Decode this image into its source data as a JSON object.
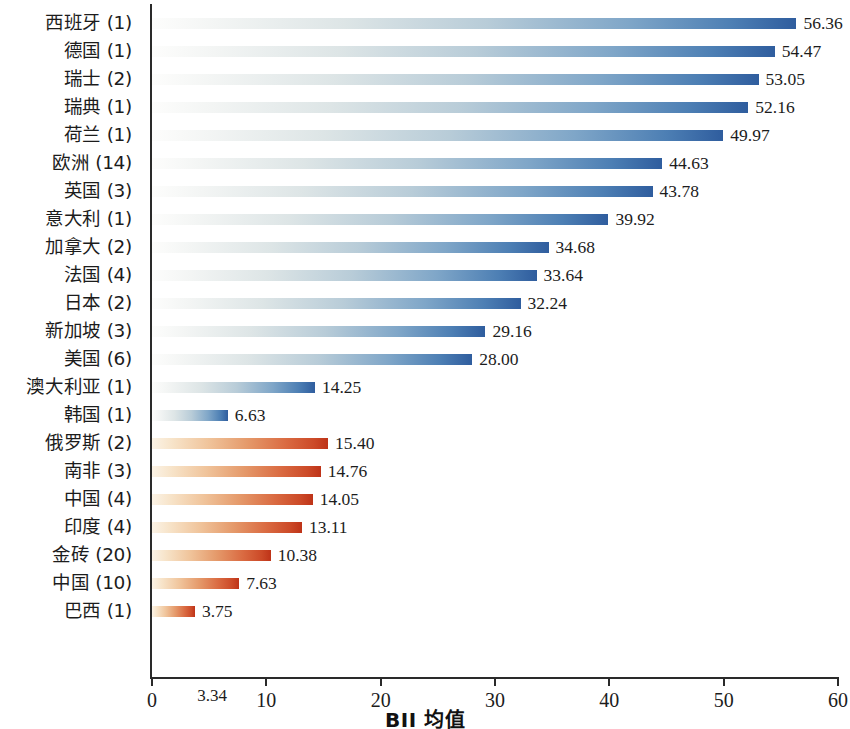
{
  "chart_data": {
    "type": "bar",
    "orientation": "horizontal",
    "title": "",
    "xlabel": "BII 均值",
    "ylabel": "",
    "xlim": [
      0,
      60
    ],
    "grid": false,
    "legend": null,
    "xticks": [
      0,
      10,
      20,
      30,
      40,
      50,
      60
    ],
    "xtick_labels": [
      "0",
      "10",
      "20",
      "30",
      "40",
      "50",
      "60"
    ],
    "annotations": [
      {
        "label": "3.34",
        "x": 3.34,
        "axis": "x",
        "note": "extra x-axis tick label"
      }
    ],
    "categories": [
      "西班牙 (1)",
      "德国 (1)",
      "瑞士 (2)",
      "瑞典 (1)",
      "荷兰 (1)",
      "欧洲 (14)",
      "英国 (3)",
      "意大利 (1)",
      "加拿大 (2)",
      "法国 (4)",
      "日本 (2)",
      "新加坡 (3)",
      "美国 (6)",
      "澳大利亚 (1)",
      "韩国 (1)",
      "俄罗斯 (2)",
      "南非 (3)",
      "中国 (4)",
      "印度 (4)",
      "金砖 (20)",
      "中国 (10)",
      "巴西 (1)"
    ],
    "values": [
      56.36,
      54.47,
      53.05,
      52.16,
      49.97,
      44.63,
      43.78,
      39.92,
      34.68,
      33.64,
      32.24,
      29.16,
      28.0,
      14.25,
      6.63,
      15.4,
      14.76,
      14.05,
      13.11,
      10.38,
      7.63,
      3.75
    ],
    "value_labels": [
      "56.36",
      "54.47",
      "53.05",
      "52.16",
      "49.97",
      "44.63",
      "43.78",
      "39.92",
      "34.68",
      "33.64",
      "32.24",
      "29.16",
      "28.00",
      "14.25",
      "6.63",
      "15.40",
      "14.76",
      "14.05",
      "13.11",
      "10.38",
      "7.63",
      "3.75"
    ],
    "series_group": [
      "blue",
      "blue",
      "blue",
      "blue",
      "blue",
      "blue",
      "blue",
      "blue",
      "blue",
      "blue",
      "blue",
      "blue",
      "blue",
      "blue",
      "blue",
      "red",
      "red",
      "red",
      "red",
      "red",
      "red",
      "red"
    ],
    "colors": {
      "blue_start": "#fdfdfc",
      "blue_end": "#2f5d9e",
      "red_start": "#fbf3e6",
      "red_end": "#be3318",
      "axis": "#2a2a2a",
      "text": "#1c1c1c",
      "background": "#ffffff"
    }
  }
}
